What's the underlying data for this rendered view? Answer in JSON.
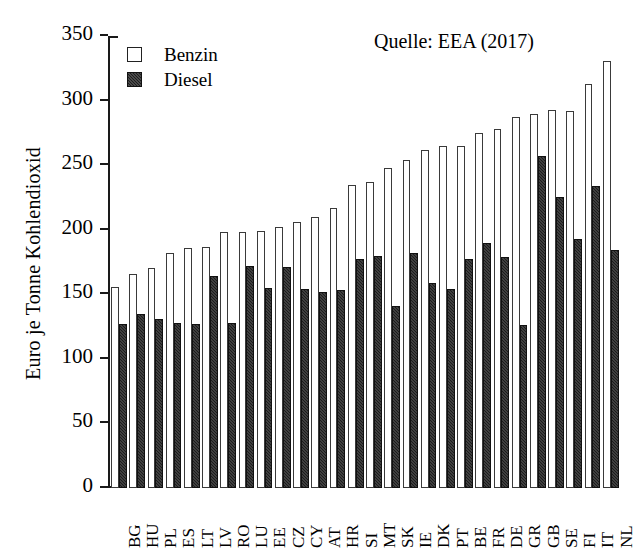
{
  "chart_data": {
    "type": "bar",
    "title": "",
    "annotation": "Quelle: EEA (2017)",
    "xlabel": "",
    "ylabel": "Euro je Tonne Kohlendioxid",
    "ylim": [
      0,
      350
    ],
    "yticks": [
      0,
      50,
      100,
      150,
      200,
      250,
      300,
      350
    ],
    "grid": false,
    "legend_position": "top-left",
    "categories": [
      "BG",
      "HU",
      "PL",
      "ES",
      "LT",
      "LV",
      "RO",
      "LU",
      "EE",
      "CZ",
      "CY",
      "AT",
      "HR",
      "SI",
      "MT",
      "SK",
      "IE",
      "DK",
      "PT",
      "BE",
      "FR",
      "DE",
      "GR",
      "GB",
      "SE",
      "FI",
      "IT",
      "NL"
    ],
    "series": [
      {
        "name": "Benzin",
        "color": "#ffffff",
        "values": [
          156,
          166,
          170,
          182,
          186,
          187,
          198,
          198,
          199,
          202,
          206,
          210,
          217,
          235,
          237,
          248,
          254,
          262,
          265,
          265,
          275,
          278,
          287,
          290,
          293,
          292,
          313,
          331
        ]
      },
      {
        "name": "Diesel",
        "color": "#1c1c1c",
        "values": [
          127,
          135,
          131,
          128,
          127,
          164,
          128,
          172,
          155,
          171,
          154,
          152,
          153,
          177,
          180,
          141,
          182,
          159,
          154,
          177,
          190,
          179,
          126,
          257,
          225,
          193,
          234,
          184
        ]
      }
    ]
  },
  "legend": {
    "entries": [
      {
        "label": "Benzin",
        "swatch": "open-square-icon"
      },
      {
        "label": "Diesel",
        "swatch": "filled-square-icon"
      }
    ]
  },
  "axis": {
    "y_label": "Euro je Tonne Kohlendioxid",
    "y_ticks": [
      "0",
      "50",
      "100",
      "150",
      "200",
      "250",
      "300",
      "350"
    ]
  },
  "source_note": "Quelle: EEA (2017)"
}
